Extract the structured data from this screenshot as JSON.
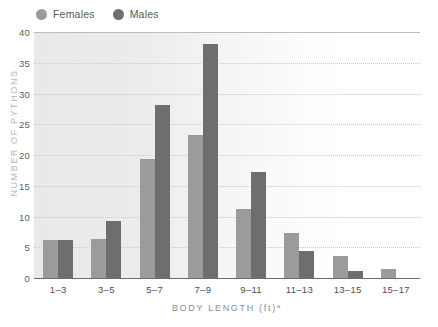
{
  "legend": {
    "position": "top-left",
    "items": [
      {
        "label": "Females",
        "color": "#9a9b9d",
        "icon": "circle-swatch-icon"
      },
      {
        "label": "Males",
        "color": "#6d6e70",
        "icon": "circle-swatch-icon"
      }
    ]
  },
  "axes": {
    "y_title": "NUMBER OF PYTHONS",
    "x_title": "BODY LENGTH (ft)*",
    "y_ticks": [
      "0",
      "5",
      "10",
      "15",
      "20",
      "25",
      "30",
      "35",
      "40"
    ]
  },
  "colors": {
    "female_bar": "#9a9b9d",
    "male_bar": "#6d6e70",
    "gridline": "#c9c9c9",
    "axis": "#6f6f6f",
    "tick_text": "#4e4f51",
    "axis_title": "#8d8e90",
    "plot_background": "#ffffff"
  },
  "chart_data": {
    "type": "bar",
    "title": "",
    "xlabel": "BODY LENGTH (ft)*",
    "ylabel": "NUMBER OF PYTHONS",
    "ylim": [
      0,
      40
    ],
    "ytick_step": 5,
    "grid": true,
    "legend_position": "top-left",
    "categories": [
      "1–3",
      "3–5",
      "5–7",
      "7–9",
      "9–11",
      "11–13",
      "13–15",
      "15–17"
    ],
    "series": [
      {
        "name": "Females",
        "color": "#9a9b9d",
        "values": [
          6.2,
          6.3,
          19.3,
          23.3,
          11.2,
          7.4,
          3.6,
          1.4
        ]
      },
      {
        "name": "Males",
        "color": "#6d6e70",
        "values": [
          6.2,
          9.2,
          28.2,
          38.1,
          17.3,
          4.4,
          1.2,
          0
        ]
      }
    ]
  }
}
